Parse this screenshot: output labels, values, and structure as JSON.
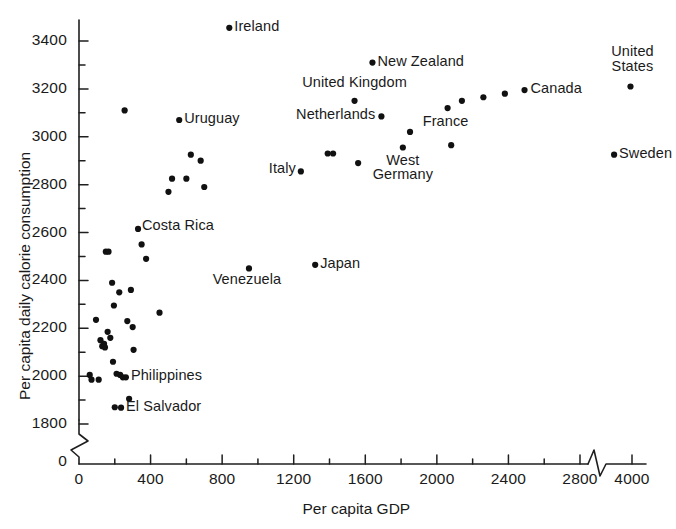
{
  "chart_data": {
    "type": "scatter",
    "title": "",
    "xlabel": "Per capita GDP",
    "ylabel": "Per capita daily calorie consumption",
    "xlim": [
      0,
      4000
    ],
    "ylim": [
      1700,
      3500
    ],
    "grid": false,
    "legend": "none",
    "axis_breaks": {
      "x": "between 2800 and 4000",
      "y": "between 0 and 1700"
    },
    "xticks": [
      0,
      400,
      800,
      1200,
      1600,
      2000,
      2400,
      2800,
      4000
    ],
    "xtick_labels": [
      "0",
      "400",
      "800",
      "1200",
      "1600",
      "2000",
      "2400",
      "2800",
      "4000"
    ],
    "yticks": [
      1800,
      2000,
      2200,
      2400,
      2600,
      2800,
      3000,
      3200,
      3400
    ],
    "ytick_labels": [
      "1800",
      "2000",
      "2200",
      "2400",
      "2600",
      "2800",
      "3000",
      "3200",
      "3400"
    ],
    "y_zero_label": "0",
    "points": [
      {
        "label": "",
        "x": 60,
        "y": 2005
      },
      {
        "label": "",
        "x": 70,
        "y": 1985
      },
      {
        "label": "",
        "x": 95,
        "y": 2235
      },
      {
        "label": "",
        "x": 110,
        "y": 1985
      },
      {
        "label": "",
        "x": 120,
        "y": 2150
      },
      {
        "label": "",
        "x": 130,
        "y": 2125
      },
      {
        "label": "",
        "x": 140,
        "y": 2135
      },
      {
        "label": "",
        "x": 145,
        "y": 2120
      },
      {
        "label": "",
        "x": 150,
        "y": 2520
      },
      {
        "label": "",
        "x": 160,
        "y": 2185
      },
      {
        "label": "",
        "x": 165,
        "y": 2520
      },
      {
        "label": "",
        "x": 175,
        "y": 2160
      },
      {
        "label": "",
        "x": 185,
        "y": 2390
      },
      {
        "label": "",
        "x": 190,
        "y": 2060
      },
      {
        "label": "",
        "x": 195,
        "y": 2295
      },
      {
        "label": "",
        "x": 200,
        "y": 1870
      },
      {
        "label": "",
        "x": 210,
        "y": 2010
      },
      {
        "label": "",
        "x": 225,
        "y": 2350
      },
      {
        "label": "",
        "x": 230,
        "y": 2005
      },
      {
        "label": "El Salvador",
        "x": 235,
        "y": 1868
      },
      {
        "label": "",
        "x": 245,
        "y": 1995
      },
      {
        "label": "",
        "x": 255,
        "y": 3110
      },
      {
        "label": "Philippines",
        "x": 262,
        "y": 1995
      },
      {
        "label": "",
        "x": 270,
        "y": 2230
      },
      {
        "label": "",
        "x": 280,
        "y": 1905
      },
      {
        "label": "",
        "x": 290,
        "y": 2360
      },
      {
        "label": "",
        "x": 300,
        "y": 2205
      },
      {
        "label": "",
        "x": 305,
        "y": 2110
      },
      {
        "label": "Costa Rica",
        "x": 330,
        "y": 2615
      },
      {
        "label": "",
        "x": 350,
        "y": 2550
      },
      {
        "label": "",
        "x": 375,
        "y": 2490
      },
      {
        "label": "",
        "x": 450,
        "y": 2265
      },
      {
        "label": "",
        "x": 500,
        "y": 2770
      },
      {
        "label": "",
        "x": 520,
        "y": 2825
      },
      {
        "label": "Uruguay",
        "x": 560,
        "y": 3070
      },
      {
        "label": "",
        "x": 600,
        "y": 2825
      },
      {
        "label": "",
        "x": 625,
        "y": 2925
      },
      {
        "label": "",
        "x": 680,
        "y": 2900
      },
      {
        "label": "",
        "x": 700,
        "y": 2790
      },
      {
        "label": "Ireland",
        "x": 840,
        "y": 3455
      },
      {
        "label": "Venezuela",
        "x": 950,
        "y": 2450
      },
      {
        "label": "Italy",
        "x": 1240,
        "y": 2855
      },
      {
        "label": "Japan",
        "x": 1320,
        "y": 2465
      },
      {
        "label": "",
        "x": 1390,
        "y": 2930
      },
      {
        "label": "",
        "x": 1420,
        "y": 2930
      },
      {
        "label": "United Kingdom",
        "x": 1540,
        "y": 3150
      },
      {
        "label": "",
        "x": 1560,
        "y": 2890
      },
      {
        "label": "New Zealand",
        "x": 1640,
        "y": 3310
      },
      {
        "label": "Netherlands",
        "x": 1690,
        "y": 3085
      },
      {
        "label": "West Germany",
        "x": 1810,
        "y": 2955
      },
      {
        "label": "",
        "x": 1850,
        "y": 3020
      },
      {
        "label": "France",
        "x": 2060,
        "y": 3120
      },
      {
        "label": "",
        "x": 2080,
        "y": 2965
      },
      {
        "label": "",
        "x": 2140,
        "y": 3150
      },
      {
        "label": "",
        "x": 2260,
        "y": 3165
      },
      {
        "label": "",
        "x": 2380,
        "y": 3180
      },
      {
        "label": "Canada",
        "x": 2490,
        "y": 3195
      },
      {
        "label": "Sweden",
        "x": 2820,
        "y": 2925
      },
      {
        "label": "United States",
        "x": 3900,
        "y": 3210
      }
    ],
    "labeled_points": [
      {
        "name": "Ireland",
        "x": 840,
        "y": 3455,
        "anchor": "left"
      },
      {
        "name": "New Zealand",
        "x": 1640,
        "y": 3310,
        "anchor": "left"
      },
      {
        "name": "United Kingdom",
        "x": 1540,
        "y": 3150,
        "anchor": "above"
      },
      {
        "name": "Netherlands",
        "x": 1690,
        "y": 3085,
        "anchor": "right"
      },
      {
        "name": "United States",
        "x": 3900,
        "y": 3210,
        "anchor": "above"
      },
      {
        "name": "Canada",
        "x": 2490,
        "y": 3195,
        "anchor": "left"
      },
      {
        "name": "France",
        "x": 2060,
        "y": 3120,
        "anchor": "below"
      },
      {
        "name": "Sweden",
        "x": 2820,
        "y": 2925,
        "anchor": "left"
      },
      {
        "name": "West Germany",
        "x": 1810,
        "y": 2955,
        "anchor": "below"
      },
      {
        "name": "Italy",
        "x": 1240,
        "y": 2855,
        "anchor": "right"
      },
      {
        "name": "Japan",
        "x": 1320,
        "y": 2465,
        "anchor": "left"
      },
      {
        "name": "Venezuela",
        "x": 950,
        "y": 2450,
        "anchor": "below"
      },
      {
        "name": "Uruguay",
        "x": 560,
        "y": 3070,
        "anchor": "left"
      },
      {
        "name": "Costa Rica",
        "x": 330,
        "y": 2615,
        "anchor": "left"
      },
      {
        "name": "Philippines",
        "x": 262,
        "y": 1995,
        "anchor": "left"
      },
      {
        "name": "El Salvador",
        "x": 235,
        "y": 1868,
        "anchor": "left"
      }
    ]
  },
  "labels": {
    "uruguay": "Uruguay",
    "ireland": "Ireland",
    "new_zealand": "New Zealand",
    "united_kingdom": "United Kingdom",
    "netherlands": "Netherlands",
    "united_states_line1": "United",
    "united_states_line2": "States",
    "canada": "Canada",
    "france": "France",
    "sweden": "Sweden",
    "west_germany_line1": "West",
    "west_germany_line2": "Germany",
    "italy": "Italy",
    "japan": "Japan",
    "venezuela": "Venezuela",
    "costa_rica": "Costa Rica",
    "philippines": "Philippines",
    "el_salvador": "El Salvador"
  },
  "axes": {
    "x_title": "Per capita GDP",
    "y_title": "Per capita daily calorie consumption",
    "y_zero": "0",
    "x_zero": "0",
    "x_tick_labels": [
      "400",
      "800",
      "1200",
      "1600",
      "2000",
      "2400",
      "2800",
      "4000"
    ],
    "y_tick_labels": [
      "3400",
      "3200",
      "3000",
      "2800",
      "2600",
      "2400",
      "2200",
      "2000",
      "1800"
    ]
  }
}
